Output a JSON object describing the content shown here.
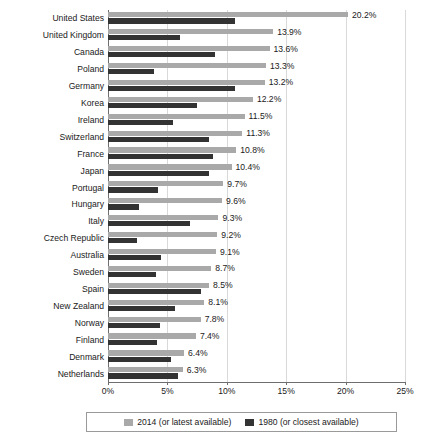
{
  "chart_data": {
    "type": "bar",
    "orientation": "horizontal",
    "title": "",
    "xlabel": "",
    "ylabel": "",
    "xlim": [
      0,
      25
    ],
    "xticks": [
      0,
      5,
      10,
      15,
      20,
      25
    ],
    "xtick_labels": [
      "0%",
      "5%",
      "10%",
      "15%",
      "20%",
      "25%"
    ],
    "grid": true,
    "legend_position": "bottom",
    "categories": [
      "United States",
      "United Kingdom",
      "Canada",
      "Poland",
      "Germany",
      "Korea",
      "Ireland",
      "Switzerland",
      "France",
      "Japan",
      "Portugal",
      "Hungary",
      "Italy",
      "Czech Republic",
      "Australia",
      "Sweden",
      "Spain",
      "New Zealand",
      "Norway",
      "Finland",
      "Denmark",
      "Netherlands"
    ],
    "series": [
      {
        "name": "2014 (or latest available)",
        "color": "#a9a9a9",
        "values": [
          20.2,
          13.9,
          13.6,
          13.3,
          13.2,
          12.2,
          11.5,
          11.3,
          10.8,
          10.4,
          9.7,
          9.6,
          9.3,
          9.2,
          9.1,
          8.7,
          8.5,
          8.1,
          7.8,
          7.4,
          6.4,
          6.3
        ],
        "labels": [
          "20.2%",
          "13.9%",
          "13.6%",
          "13.3%",
          "13.2%",
          "12.2%",
          "11.5%",
          "11.3%",
          "10.8%",
          "10.4%",
          "9.7%",
          "9.6%",
          "9.3%",
          "9.2%",
          "9.1%",
          "8.7%",
          "8.5%",
          "8.1%",
          "7.8%",
          "7.4%",
          "6.4%",
          "6.3%"
        ]
      },
      {
        "name": "1980 (or closest available)",
        "color": "#333333",
        "values": [
          10.7,
          6.1,
          9.0,
          3.9,
          10.7,
          7.5,
          5.5,
          8.5,
          8.8,
          8.5,
          4.2,
          2.6,
          6.9,
          2.4,
          4.5,
          4.0,
          7.8,
          5.6,
          4.4,
          4.1,
          5.3,
          5.9
        ],
        "labels": []
      }
    ]
  },
  "legend": {
    "items": [
      {
        "label": "2014 (or latest available)",
        "color": "#a9a9a9"
      },
      {
        "label": "1980 (or closest available)",
        "color": "#333333"
      }
    ]
  }
}
